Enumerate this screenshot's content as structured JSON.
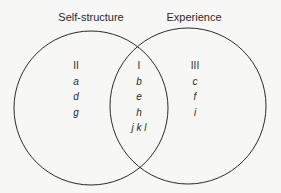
{
  "diagram": {
    "type": "venn",
    "circles": [
      {
        "label": "Self-structure",
        "cx": 91,
        "cy": 108,
        "r": 77
      },
      {
        "label": "Experience",
        "cx": 188,
        "cy": 106,
        "r": 78
      }
    ],
    "regions": {
      "left": {
        "numeral": "II",
        "items": [
          "a",
          "d",
          "g"
        ]
      },
      "overlap": {
        "numeral": "I",
        "items": [
          "b",
          "e",
          "h",
          "j k l"
        ]
      },
      "right": {
        "numeral": "III",
        "items": [
          "c",
          "f",
          "i"
        ]
      }
    },
    "stroke_color": "#2a2a2a",
    "background": "#f7f7f5"
  }
}
